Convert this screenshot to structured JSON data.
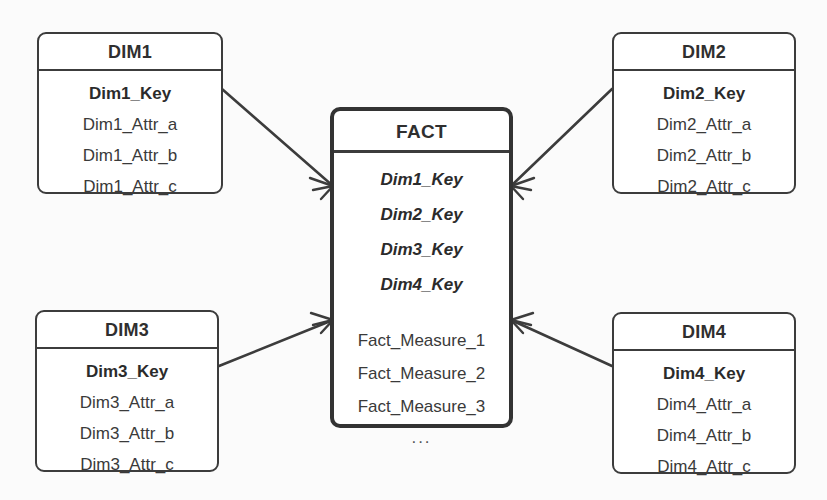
{
  "diagram": {
    "type": "star-schema-er-diagram",
    "notation": "crow's foot",
    "background_color": "#fbfbfb",
    "line_color": "#3c3c3c",
    "entity_border_color": "#3c3c3c",
    "fact_border_color": "#333333"
  },
  "fact": {
    "name": "FACT",
    "foreign_keys": [
      "Dim1_Key",
      "Dim2_Key",
      "Dim3_Key",
      "Dim4_Key"
    ],
    "measures": [
      "Fact_Measure_1",
      "Fact_Measure_2",
      "Fact_Measure_3"
    ],
    "ellipsis": "..."
  },
  "dimensions": [
    {
      "id": "dim1",
      "name": "DIM1",
      "key": "Dim1_Key",
      "attributes": [
        "Dim1_Attr_a",
        "Dim1_Attr_b",
        "Dim1_Attr_c"
      ]
    },
    {
      "id": "dim2",
      "name": "DIM2",
      "key": "Dim2_Key",
      "attributes": [
        "Dim2_Attr_a",
        "Dim2_Attr_b",
        "Dim2_Attr_c"
      ]
    },
    {
      "id": "dim3",
      "name": "DIM3",
      "key": "Dim3_Key",
      "attributes": [
        "Dim3_Attr_a",
        "Dim3_Attr_b",
        "Dim3_Attr_c"
      ]
    },
    {
      "id": "dim4",
      "name": "DIM4",
      "key": "Dim4_Key",
      "attributes": [
        "Dim4_Attr_a",
        "Dim4_Attr_b",
        "Dim4_Attr_c"
      ]
    }
  ],
  "relationships": [
    {
      "from": "DIM1",
      "to": "FACT",
      "cardinality": "one-to-many"
    },
    {
      "from": "DIM2",
      "to": "FACT",
      "cardinality": "one-to-many"
    },
    {
      "from": "DIM3",
      "to": "FACT",
      "cardinality": "one-to-many"
    },
    {
      "from": "DIM4",
      "to": "FACT",
      "cardinality": "one-to-many"
    }
  ]
}
